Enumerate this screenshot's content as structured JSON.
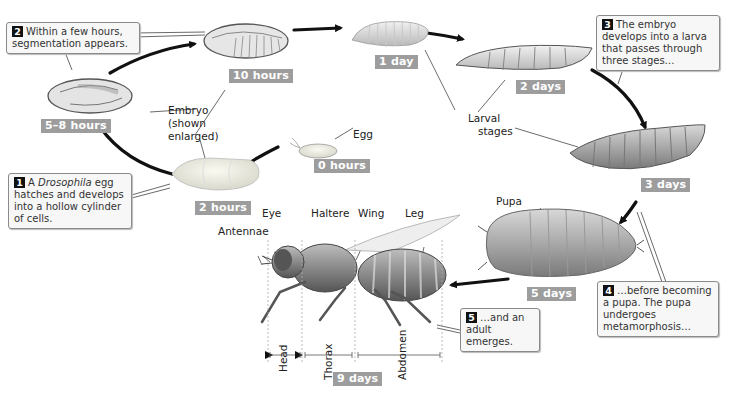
{
  "figure": {
    "stages": [
      {
        "id": "egg",
        "time": "0 hours"
      },
      {
        "id": "hollow-cylinder",
        "time": "2 hours"
      },
      {
        "id": "segmenting-embryo",
        "time": "5–8 hours"
      },
      {
        "id": "segmented-embryo",
        "time": "10 hours"
      },
      {
        "id": "first-larva",
        "time": "1 day"
      },
      {
        "id": "second-larva",
        "time": "2 days"
      },
      {
        "id": "third-larva",
        "time": "3 days"
      },
      {
        "id": "pupa",
        "time": "5 days"
      },
      {
        "id": "adult",
        "time": "9 days"
      }
    ],
    "labels": {
      "egg": "Egg",
      "embryo_line1": "Embryo",
      "embryo_line2": "(shown",
      "embryo_line3": "enlarged)",
      "larval_line1": "Larval",
      "larval_line2": "stages",
      "pupa": "Pupa",
      "eye": "Eye",
      "haltere": "Haltere",
      "wing": "Wing",
      "leg": "Leg",
      "antennae": "Antennae",
      "head": "Head",
      "thorax": "Thorax",
      "abdomen": "Abdomen"
    },
    "callouts": [
      {
        "number": "1",
        "text_pre": "A ",
        "text_italic": "Drosophila",
        "text_post": " egg hatches and develops into a hollow cylinder of cells."
      },
      {
        "number": "2",
        "text": "Within a few hours, segmentation appears."
      },
      {
        "number": "3",
        "text": "The embryo develops into a larva that passes through three stages…"
      },
      {
        "number": "4",
        "text": "…before becoming a pupa. The pupa undergoes metamorphosis…"
      },
      {
        "number": "5",
        "text": "…and an adult emerges."
      }
    ],
    "colors": {
      "time_badge": "#9d9d9d",
      "arrow": "#111111",
      "callout_bg": "#f7f7f7",
      "number_badge": "#111111"
    }
  }
}
